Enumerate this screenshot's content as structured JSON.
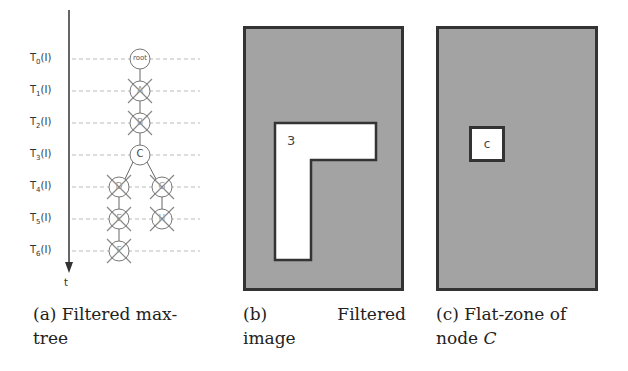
{
  "panel_a": {
    "axis_label": "t",
    "levels": [
      "T",
      "T",
      "T",
      "T",
      "T",
      "T",
      "T"
    ],
    "level_subscripts": [
      "0",
      "1",
      "2",
      "3",
      "4",
      "5",
      "6"
    ],
    "level_suffix": "(I)",
    "nodes": [
      {
        "label": "root",
        "filtered": false
      },
      {
        "label": "A",
        "filtered": true
      },
      {
        "label": "B",
        "filtered": true
      },
      {
        "label": "C",
        "filtered": false
      },
      {
        "label": "D",
        "filtered": true
      },
      {
        "label": "E",
        "filtered": true
      },
      {
        "label": "F",
        "filtered": true
      },
      {
        "label": "G",
        "filtered": true
      },
      {
        "label": "H",
        "filtered": true
      }
    ],
    "caption_line1": "(a) Filtered max-",
    "caption_line2": "tree"
  },
  "panel_b": {
    "region_label": "3",
    "caption_line1_left": "(b)",
    "caption_line1_right": "Filtered",
    "caption_line2": "image"
  },
  "panel_c": {
    "region_label": "c",
    "caption_line1": "(c) Flat-zone of",
    "caption_line2_prefix": "node ",
    "caption_line2_italic": "C"
  },
  "colors": {
    "background_gray": "#a3a3a3",
    "border": "#333333",
    "region_white": "#ffffff",
    "node_stroke": "#888888"
  }
}
